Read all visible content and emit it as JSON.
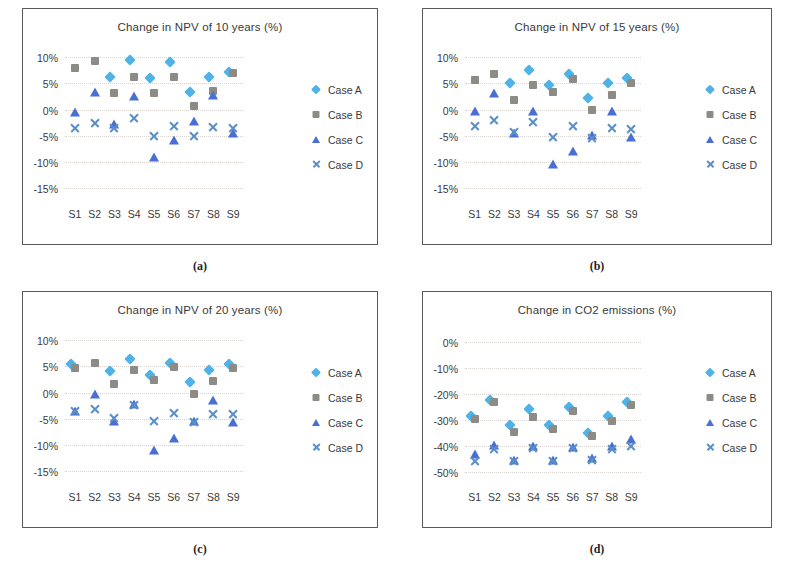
{
  "figure": {
    "panels": [
      {
        "key": "a",
        "caption": "(a)",
        "title": "Change in NPV of 10 years (%)",
        "ytick_labels": [
          "10%",
          "5%",
          "0%",
          "-5%",
          "-10%",
          "-15%"
        ],
        "xtick_labels": [
          "S1",
          "S2",
          "S3",
          "S4",
          "S5",
          "S6",
          "S7",
          "S8",
          "S9"
        ],
        "legend": [
          {
            "label": "Case A",
            "marker": "diamond",
            "color": "#4fb3e8"
          },
          {
            "label": "Case B",
            "marker": "square",
            "color": "#8d8b86"
          },
          {
            "label": "Case C",
            "marker": "triangle",
            "color": "#4a6fd4"
          },
          {
            "label": "Case D",
            "marker": "cross",
            "color": "#5b8fc9"
          }
        ]
      },
      {
        "key": "b",
        "caption": "(b)",
        "title": "Change in NPV of 15 years  (%)",
        "ytick_labels": [
          "10%",
          "5%",
          "0%",
          "-5%",
          "-10%",
          "-15%"
        ],
        "xtick_labels": [
          "S1",
          "S2",
          "S3",
          "S4",
          "S5",
          "S6",
          "S7",
          "S8",
          "S9"
        ],
        "legend": [
          {
            "label": "Case A",
            "marker": "diamond",
            "color": "#4fb3e8"
          },
          {
            "label": "Case B",
            "marker": "square",
            "color": "#8d8b86"
          },
          {
            "label": "Case C",
            "marker": "triangle",
            "color": "#4a6fd4"
          },
          {
            "label": "Case D",
            "marker": "cross",
            "color": "#5b8fc9"
          }
        ]
      },
      {
        "key": "c",
        "caption": "(c)",
        "title": "Change in NPV of 20 years  (%)",
        "ytick_labels": [
          "10%",
          "5%",
          "0%",
          "-5%",
          "-10%",
          "-15%"
        ],
        "xtick_labels": [
          "S1",
          "S2",
          "S3",
          "S4",
          "S5",
          "S6",
          "S7",
          "S8",
          "S9"
        ],
        "legend": [
          {
            "label": "Case A",
            "marker": "diamond",
            "color": "#4fb3e8"
          },
          {
            "label": "Case B",
            "marker": "square",
            "color": "#8d8b86"
          },
          {
            "label": "Case C",
            "marker": "triangle",
            "color": "#4a6fd4"
          },
          {
            "label": "Case D",
            "marker": "cross",
            "color": "#5b8fc9"
          }
        ]
      },
      {
        "key": "d",
        "caption": "(d)",
        "title": "Change in CO2 emissions (%)",
        "ytick_labels": [
          "0%",
          "-10%",
          "-20%",
          "-30%",
          "-40%",
          "-50%"
        ],
        "xtick_labels": [
          "S1",
          "S2",
          "S3",
          "S4",
          "S5",
          "S6",
          "S7",
          "S8",
          "S9"
        ],
        "legend": [
          {
            "label": "Case A",
            "marker": "diamond",
            "color": "#4fb3e8"
          },
          {
            "label": "Case B",
            "marker": "square",
            "color": "#8d8b86"
          },
          {
            "label": "Case C",
            "marker": "triangle",
            "color": "#4a6fd4"
          },
          {
            "label": "Case D",
            "marker": "cross",
            "color": "#5b8fc9"
          }
        ]
      }
    ]
  },
  "chart_data": [
    {
      "panel": "a",
      "type": "scatter",
      "title": "Change in NPV of 10 years (%)",
      "xlabel": "",
      "ylabel": "",
      "categories": [
        "S1",
        "S2",
        "S3",
        "S4",
        "S5",
        "S6",
        "S7",
        "S8",
        "S9"
      ],
      "yticks": [
        10,
        5,
        0,
        -5,
        -10,
        -15
      ],
      "ylim": [
        -17,
        11.5
      ],
      "grid": true,
      "legend_position": "right",
      "series": [
        {
          "name": "Case A",
          "marker": "diamond",
          "color": "#4fb3e8",
          "values": [
            null,
            null,
            5.4,
            8.6,
            5.3,
            8.3,
            2.6,
            5.4,
            6.4
          ]
        },
        {
          "name": "Case B",
          "marker": "square",
          "color": "#8d8b86",
          "values": [
            7.8,
            9.2,
            3.2,
            6.2,
            3.1,
            6.1,
            0.6,
            3.5,
            7.0
          ]
        },
        {
          "name": "Case C",
          "marker": "triangle",
          "color": "#4a6fd4",
          "values": [
            -0.4,
            3.3,
            -2.8,
            2.5,
            -9.1,
            -5.7,
            -2.1,
            2.7,
            -4.5
          ]
        },
        {
          "name": "Case D",
          "marker": "cross",
          "color": "#5b8fc9",
          "values": [
            -3.6,
            -2.5,
            -3.6,
            -1.6,
            -5.1,
            -3.1,
            -5.1,
            -3.4,
            -3.6
          ]
        }
      ]
    },
    {
      "panel": "b",
      "type": "scatter",
      "title": "Change in NPV of 15 years  (%)",
      "xlabel": "",
      "ylabel": "",
      "categories": [
        "S1",
        "S2",
        "S3",
        "S4",
        "S5",
        "S6",
        "S7",
        "S8",
        "S9"
      ],
      "yticks": [
        10,
        5,
        0,
        -5,
        -10,
        -15
      ],
      "ylim": [
        -17,
        11.5
      ],
      "grid": true,
      "legend_position": "right",
      "series": [
        {
          "name": "Case A",
          "marker": "diamond",
          "color": "#4fb3e8",
          "values": [
            null,
            null,
            4.3,
            6.8,
            3.9,
            6.0,
            1.4,
            4.3,
            5.2
          ]
        },
        {
          "name": "Case B",
          "marker": "square",
          "color": "#8d8b86",
          "values": [
            5.7,
            6.8,
            1.9,
            4.7,
            3.4,
            5.8,
            0.0,
            2.8,
            5.1
          ]
        },
        {
          "name": "Case C",
          "marker": "triangle",
          "color": "#4a6fd4",
          "values": [
            -0.3,
            3.2,
            -4.5,
            -0.2,
            -10.4,
            -7.9,
            -4.8,
            -0.2,
            -5.2
          ]
        },
        {
          "name": "Case D",
          "marker": "cross",
          "color": "#5b8fc9",
          "values": [
            -3.1,
            -2.0,
            -4.3,
            -2.3,
            -5.2,
            -3.2,
            -5.4,
            -3.5,
            -3.7
          ]
        }
      ]
    },
    {
      "panel": "c",
      "type": "scatter",
      "title": "Change in NPV of 20 years  (%)",
      "xlabel": "",
      "ylabel": "",
      "categories": [
        "S1",
        "S2",
        "S3",
        "S4",
        "S5",
        "S6",
        "S7",
        "S8",
        "S9"
      ],
      "yticks": [
        10,
        5,
        0,
        -5,
        -10,
        -15
      ],
      "ylim": [
        -17,
        11.5
      ],
      "grid": true,
      "legend_position": "right",
      "series": [
        {
          "name": "Case A",
          "marker": "diamond",
          "color": "#4fb3e8",
          "values": [
            4.6,
            null,
            3.3,
            5.7,
            2.6,
            4.9,
            1.3,
            3.5,
            4.6
          ]
        },
        {
          "name": "Case B",
          "marker": "square",
          "color": "#8d8b86",
          "values": [
            4.6,
            5.6,
            1.6,
            4.2,
            2.4,
            4.9,
            -0.3,
            2.1,
            4.7
          ]
        },
        {
          "name": "Case C",
          "marker": "triangle",
          "color": "#4a6fd4",
          "values": [
            -3.6,
            -0.2,
            -5.5,
            -2.1,
            -11.0,
            -8.6,
            -5.5,
            -1.5,
            -5.6
          ]
        },
        {
          "name": "Case D",
          "marker": "cross",
          "color": "#5b8fc9",
          "values": [
            -3.6,
            -3.2,
            -4.8,
            -2.3,
            -5.4,
            -3.9,
            -5.6,
            -4.0,
            -4.0
          ]
        }
      ]
    },
    {
      "panel": "d",
      "type": "scatter",
      "title": "Change in CO2 emissions (%)",
      "xlabel": "",
      "ylabel": "",
      "categories": [
        "S1",
        "S2",
        "S3",
        "S4",
        "S5",
        "S6",
        "S7",
        "S8",
        "S9"
      ],
      "yticks": [
        0,
        -10,
        -20,
        -30,
        -40,
        -50
      ],
      "ylim": [
        -54,
        4
      ],
      "grid": true,
      "legend_position": "right",
      "series": [
        {
          "name": "Case A",
          "marker": "diamond",
          "color": "#4fb3e8",
          "values": [
            -30.2,
            -23.9,
            -33.5,
            -27.3,
            -33.6,
            -26.7,
            -36.6,
            -30.0,
            -24.6
          ]
        },
        {
          "name": "Case B",
          "marker": "square",
          "color": "#8d8b86",
          "values": [
            -29.8,
            -23.2,
            -34.5,
            -28.8,
            -33.4,
            -26.7,
            -36.4,
            -30.6,
            -24.4
          ]
        },
        {
          "name": "Case C",
          "marker": "triangle",
          "color": "#4a6fd4",
          "values": [
            -43.3,
            -39.5,
            -45.3,
            -40.2,
            -45.6,
            -40.6,
            -44.9,
            -39.9,
            -37.3
          ]
        },
        {
          "name": "Case D",
          "marker": "cross",
          "color": "#5b8fc9",
          "values": [
            -45.8,
            -41.2,
            -45.8,
            -40.8,
            -45.9,
            -40.7,
            -45.5,
            -41.1,
            -39.9
          ]
        }
      ]
    }
  ]
}
